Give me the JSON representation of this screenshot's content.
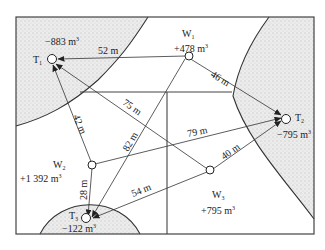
{
  "diagram": {
    "title": "",
    "colors": {
      "line": "#333333",
      "fill_stipple": "#e6e6e6",
      "frame": "#444444"
    },
    "nodes": {
      "T1": {
        "name": "T",
        "sub": "1",
        "volume": "−883 m",
        "sup": "3"
      },
      "T2": {
        "name": "T",
        "sub": "2",
        "volume": "−795 m",
        "sup": "3"
      },
      "T3": {
        "name": "T",
        "sub": "3",
        "volume": "−122 m",
        "sup": "3"
      },
      "W1": {
        "name": "W",
        "sub": "1",
        "volume": "+478 m",
        "sup": "3"
      },
      "W2": {
        "name": "W",
        "sub": "2",
        "volume": "+1 392 m",
        "sup": "3"
      },
      "W3": {
        "name": "W",
        "sub": "3",
        "volume": "+795 m",
        "sup": "3"
      }
    },
    "edges": [
      {
        "from": "W1",
        "to": "T1",
        "distance": "52 m"
      },
      {
        "from": "W1",
        "to": "T2",
        "distance": "46 m"
      },
      {
        "from": "W1",
        "to": "T3",
        "distance": "82 m"
      },
      {
        "from": "W3",
        "to": "T1",
        "distance": "75 m"
      },
      {
        "from": "W2",
        "to": "T1",
        "distance": "42 m"
      },
      {
        "from": "W2",
        "to": "T2",
        "distance": "79 m"
      },
      {
        "from": "W2",
        "to": "T3",
        "distance": "28 m"
      },
      {
        "from": "W3",
        "to": "T2",
        "distance": "40 m"
      },
      {
        "from": "W3",
        "to": "T3",
        "distance": "54 m"
      }
    ]
  }
}
